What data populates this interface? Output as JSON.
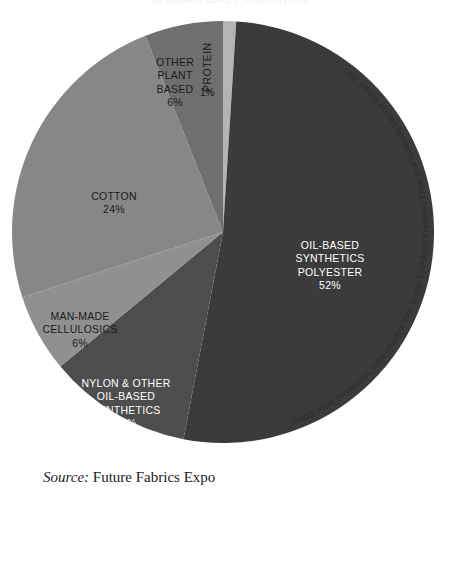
{
  "document": {
    "title": "GLOBAL FIBRE PRODUCTION",
    "source_label": "Source:",
    "source_value": "Future Fabrics Expo"
  },
  "chart_data": {
    "type": "pie",
    "title": "GLOBAL FIBRE PRODUCTION",
    "caption": "Global Fibre Production, Data adapted from Textile Exchange Preferred Fibre and Materials Market Report 2021",
    "categories": [
      "PROTEIN",
      "OIL-BASED SYNTHETICS POLYESTER",
      "NYLON & OTHER OIL-BASED SYNTHETICS",
      "MAN-MADE CELLULOSICS",
      "COTTON",
      "OTHER PLANT BASED"
    ],
    "values": [
      1,
      52,
      11,
      6,
      24,
      6
    ],
    "unit": "%",
    "legend": "none",
    "start_angle_deg": 0,
    "direction": "clockwise",
    "slices": [
      {
        "name": "PROTEIN",
        "label": "PROTEIN",
        "value": 1,
        "value_label": "1%",
        "color": "#b4b4b4",
        "label_color": "#1b1b1b",
        "start_deg": 0,
        "end_deg": 3.6
      },
      {
        "name": "OIL-BASED SYNTHETICS POLYESTER",
        "label": "OIL-BASED\nSYNTHETICS\nPOLYESTER",
        "value": 52,
        "value_label": "52%",
        "color": "#3b3b3b",
        "label_color": "#ffffff",
        "start_deg": 3.6,
        "end_deg": 190.8
      },
      {
        "name": "NYLON & OTHER OIL-BASED SYNTHETICS",
        "label": "NYLON & OTHER\nOIL-BASED\nSYNTHETICS",
        "value": 11,
        "value_label": "11%",
        "color": "#4d4d4d",
        "label_color": "#ffffff",
        "start_deg": 190.8,
        "end_deg": 230.4
      },
      {
        "name": "MAN-MADE CELLULOSICS",
        "label": "MAN-MADE\nCELLULOSICS",
        "value": 6,
        "value_label": "6%",
        "color": "#909090",
        "label_color": "#1b1b1b",
        "start_deg": 230.4,
        "end_deg": 252.0
      },
      {
        "name": "COTTON",
        "label": "COTTON",
        "value": 24,
        "value_label": "24%",
        "color": "#878787",
        "label_color": "#1b1b1b",
        "start_deg": 252.0,
        "end_deg": 338.4
      },
      {
        "name": "OTHER PLANT BASED",
        "label": "OTHER\nPLANT\nBASED",
        "value": 6,
        "value_label": "6%",
        "color": "#6f6f6f",
        "label_color": "#1b1b1b",
        "start_deg": 338.4,
        "end_deg": 360.0
      }
    ],
    "colors": {
      "protein": "#b4b4b4",
      "polyester": "#3b3b3b",
      "nylon": "#4d4d4d",
      "cellulosics": "#909090",
      "cotton": "#878787",
      "other_plant": "#6f6f6f",
      "background": "#ffffff"
    }
  }
}
